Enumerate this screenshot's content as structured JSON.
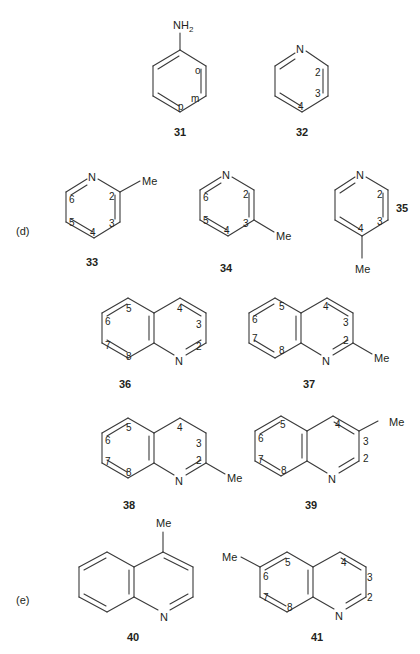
{
  "figure": {
    "parts": [
      {
        "id": "d",
        "label": "(d)"
      },
      {
        "id": "e",
        "label": "(e)"
      }
    ],
    "compounds": {
      "c31": {
        "number": "31",
        "substituent": "NH",
        "substituent_sub": "2",
        "positions": {
          "o": "o",
          "m": "m",
          "p": "p"
        }
      },
      "c32": {
        "number": "32",
        "heteroatom": "N",
        "positions": {
          "p2": "2",
          "p3": "3",
          "p4": "4"
        }
      },
      "c33": {
        "number": "33",
        "heteroatom": "N",
        "substituent": "Me",
        "positions": {
          "p2": "2",
          "p3": "3",
          "p4": "4",
          "p5": "5",
          "p6": "6"
        }
      },
      "c34": {
        "number": "34",
        "heteroatom": "N",
        "substituent": "Me",
        "positions": {
          "p2": "2",
          "p3": "3",
          "p4": "4",
          "p5": "5",
          "p6": "6"
        }
      },
      "c35": {
        "number": "35",
        "heteroatom": "N",
        "substituent": "Me",
        "positions": {
          "p2": "2",
          "p3": "3",
          "p4": "4"
        }
      },
      "c36": {
        "number": "36",
        "heteroatom": "N",
        "positions": {
          "p2": "2",
          "p3": "3",
          "p4": "4",
          "p5": "5",
          "p6": "6",
          "p7": "7",
          "p8": "8"
        }
      },
      "c37": {
        "number": "37",
        "heteroatom": "N",
        "substituent": "Me",
        "positions": {
          "p2": "2",
          "p3": "3",
          "p4": "4",
          "p5": "5",
          "p6": "6",
          "p7": "7",
          "p8": "8"
        }
      },
      "c38": {
        "number": "38",
        "heteroatom": "N",
        "substituent": "Me",
        "positions": {
          "p2": "2",
          "p3": "3",
          "p4": "4",
          "p5": "5",
          "p6": "6",
          "p7": "7",
          "p8": "8"
        }
      },
      "c39": {
        "number": "39",
        "heteroatom": "N",
        "substituent": "Me",
        "positions": {
          "p2": "2",
          "p3": "3",
          "p4": "4",
          "p5": "5",
          "p6": "6",
          "p7": "7",
          "p8": "8"
        }
      },
      "c40": {
        "number": "40",
        "heteroatom": "N",
        "substituent": "Me"
      },
      "c41": {
        "number": "41",
        "heteroatom": "N",
        "substituent": "Me",
        "positions": {
          "p2": "2",
          "p3": "3",
          "p4": "4",
          "p5": "5",
          "p6": "6",
          "p7": "7",
          "p8": "8"
        }
      }
    }
  }
}
